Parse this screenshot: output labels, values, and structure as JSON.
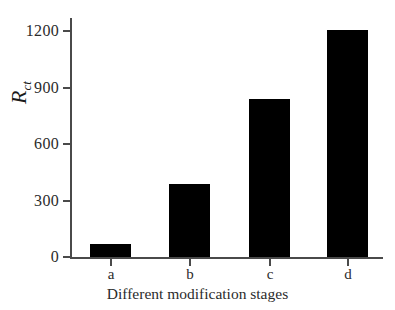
{
  "chart_data": {
    "type": "bar",
    "title": "",
    "categories": [
      "a",
      "b",
      "c",
      "d"
    ],
    "values": [
      75,
      390,
      840,
      1205
    ],
    "xlabel": "Different modification stages",
    "ylabel": "R_ct",
    "ylabel_main": "R",
    "ylabel_sub": "ct",
    "ylim": [
      0,
      1300
    ],
    "yticks": [
      0,
      300,
      600,
      900,
      1200
    ],
    "ytick_labels": [
      "0",
      "300",
      "600",
      "900",
      "1200"
    ],
    "grid": false,
    "legend": false,
    "bar_color": "#000000",
    "axis_color": "#4a4a4a",
    "text_color": "#2b2b2b"
  }
}
